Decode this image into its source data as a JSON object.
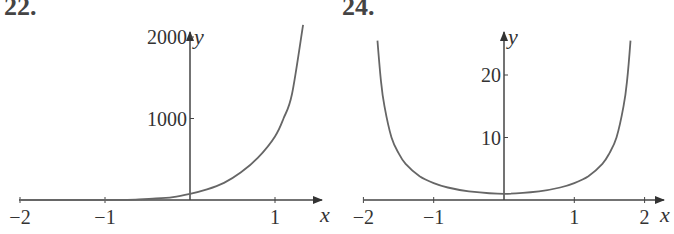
{
  "panels": [
    {
      "label": "22."
    },
    {
      "label": "24."
    }
  ],
  "chart_data": [
    {
      "type": "line",
      "title": "22.",
      "xlabel": "x",
      "ylabel": "y",
      "xlim": [
        -2,
        1.35
      ],
      "ylim": [
        0,
        2200
      ],
      "xticks": [
        -2,
        -1,
        1
      ],
      "xtick_labels": [
        "−2",
        "−1",
        "1"
      ],
      "yticks": [
        1000,
        2000
      ],
      "ytick_labels": [
        "1000",
        "2000"
      ],
      "grid": false,
      "x": [
        -2,
        -1,
        -0.8,
        -0.6,
        -0.4,
        -0.2,
        0,
        0.2,
        0.4,
        0.6,
        0.8,
        1.0,
        1.1,
        1.2,
        1.33
      ],
      "y": [
        0,
        0,
        2,
        8,
        18,
        35,
        75,
        130,
        210,
        340,
        520,
        780,
        1000,
        1300,
        2150
      ]
    },
    {
      "type": "line",
      "title": "24.",
      "xlabel": "x",
      "ylabel": "y",
      "xlim": [
        -2,
        2.1
      ],
      "ylim": [
        0,
        26
      ],
      "xticks": [
        -2,
        -1,
        1,
        2
      ],
      "xtick_labels": [
        "−2",
        "−1",
        "1",
        "2"
      ],
      "yticks": [
        10,
        20
      ],
      "ytick_labels": [
        "10",
        "20"
      ],
      "grid": false,
      "x": [
        -1.8,
        -1.75,
        -1.7,
        -1.6,
        -1.5,
        -1.4,
        -1.2,
        -1.0,
        -0.8,
        -0.5,
        0,
        0.5,
        0.8,
        1.0,
        1.2,
        1.4,
        1.5,
        1.6,
        1.7,
        1.75,
        1.8
      ],
      "y": [
        25.5,
        19,
        15,
        10,
        7.5,
        5.8,
        3.8,
        2.7,
        2.0,
        1.4,
        1.0,
        1.4,
        2.0,
        2.7,
        3.8,
        5.8,
        7.5,
        10,
        15,
        19,
        25.5
      ]
    }
  ]
}
